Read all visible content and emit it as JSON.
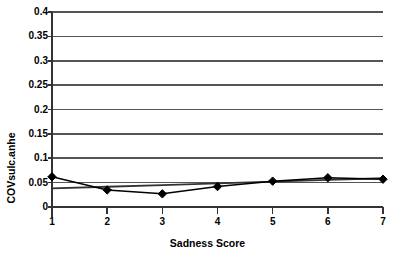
{
  "chart_data": {
    "type": "line",
    "title": "",
    "xlabel": "Sadness Score",
    "ylabel": "COVsulc.anhe",
    "x": [
      1,
      2,
      3,
      4,
      5,
      6,
      7
    ],
    "values": [
      0.062,
      0.035,
      0.027,
      0.042,
      0.053,
      0.06,
      0.057
    ],
    "series": [
      {
        "name": "COVsulc.anhe",
        "values": [
          0.062,
          0.035,
          0.027,
          0.042,
          0.053,
          0.06,
          0.057
        ],
        "marker": "diamond",
        "color": "#000000"
      },
      {
        "name": "linear trendline",
        "values": [
          0.038,
          0.0415,
          0.045,
          0.0485,
          0.052,
          0.0555,
          0.059
        ],
        "marker": "none",
        "color": "#333333"
      }
    ],
    "xlim": [
      1,
      7
    ],
    "ylim": [
      0,
      0.4
    ],
    "xticks": [
      1,
      2,
      3,
      4,
      5,
      6,
      7
    ],
    "xtick_labels": [
      "1",
      "2",
      "3",
      "4",
      "5",
      "6",
      "7"
    ],
    "yticks": [
      0,
      0.05,
      0.1,
      0.15,
      0.2,
      0.25,
      0.3,
      0.35,
      0.4
    ],
    "ytick_labels": [
      "0",
      "0.05",
      "0.1",
      "0.15",
      "0.2",
      "0.25",
      "0.3",
      "0.35",
      "0.4"
    ],
    "grid": "horizontal",
    "legend": "none",
    "background": "#ffffff",
    "line_color": "#1a1a1a",
    "grid_color": "#555555",
    "axis_color": "#333333"
  }
}
